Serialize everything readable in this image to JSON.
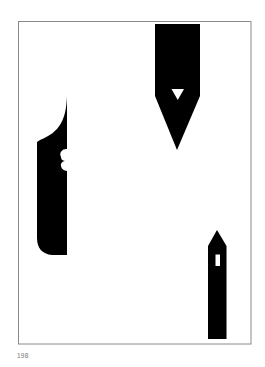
{
  "page": {
    "number": "198",
    "background_color": "#ffffff",
    "frame_color": "#8a8a8a",
    "ink_color": "#000000"
  },
  "artwork": {
    "shapes": [
      {
        "name": "pen-nib",
        "description": "Black pen nib pointing down with triangular breather hole"
      },
      {
        "name": "blade",
        "description": "Black blade-like shape with curved tip and two scallop notches"
      },
      {
        "name": "tower",
        "description": "Black narrow tower with pointed roof and slot window"
      }
    ]
  }
}
